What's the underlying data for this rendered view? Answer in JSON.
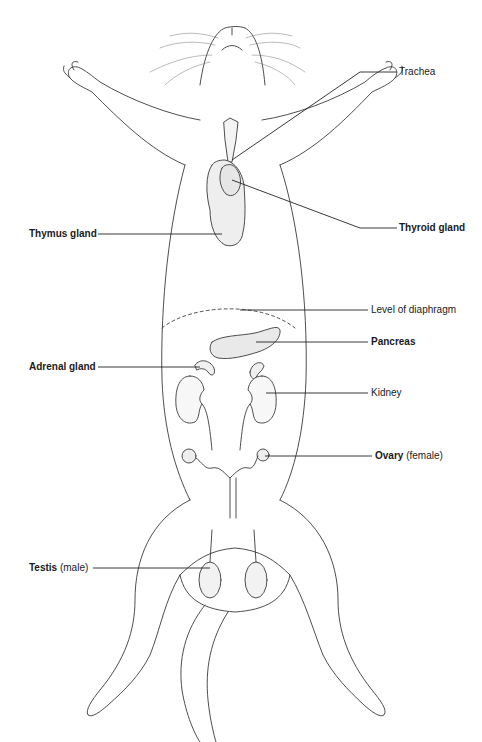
{
  "diagram": {
    "colors": {
      "outline": "#3a3a3a",
      "leader": "#222222",
      "organ_fill": "#eeeeee",
      "background": "#ffffff"
    },
    "labels": [
      {
        "id": "trachea",
        "text": "Trachea",
        "bold": false,
        "note": ""
      },
      {
        "id": "thyroid",
        "text": "Thyroid gland",
        "bold": true,
        "note": ""
      },
      {
        "id": "thymus",
        "text": "Thymus gland",
        "bold": true,
        "note": ""
      },
      {
        "id": "diaphragm",
        "text": "Level of diaphragm",
        "bold": false,
        "note": ""
      },
      {
        "id": "pancreas",
        "text": "Pancreas",
        "bold": true,
        "note": ""
      },
      {
        "id": "adrenal",
        "text": "Adrenal gland",
        "bold": true,
        "note": ""
      },
      {
        "id": "kidney",
        "text": "Kidney",
        "bold": false,
        "note": ""
      },
      {
        "id": "ovary",
        "text": "Ovary",
        "bold": true,
        "note": "(female)"
      },
      {
        "id": "testis",
        "text": "Testis",
        "bold": true,
        "note": "(male)"
      }
    ]
  }
}
